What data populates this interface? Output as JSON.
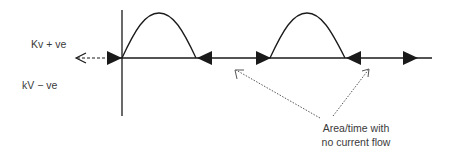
{
  "labels": {
    "positive": "Kv + ve",
    "negative": "kV − ve"
  },
  "annotation": {
    "line1": "Area/time with",
    "line2": "no current flow"
  },
  "colors": {
    "stroke": "#1a1a1a",
    "text": "#3a3a3a",
    "dotted": "#555555"
  }
}
